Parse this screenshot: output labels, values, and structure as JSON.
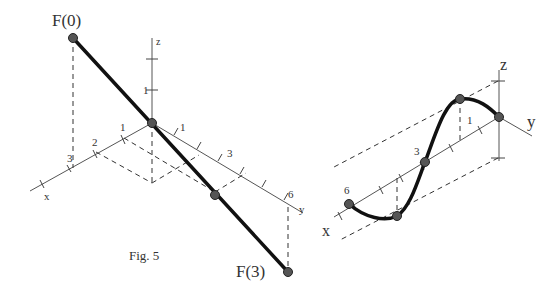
{
  "figure": {
    "caption": "Fig. 5",
    "left_panel": {
      "point_labels": {
        "start": "F(0)",
        "end": "F(3)"
      },
      "axis_labels": {
        "x": "x",
        "y": "y",
        "z": "z"
      },
      "x_ticks": [
        "1",
        "2",
        "3"
      ],
      "y_ticks": [
        "1",
        "3",
        "6"
      ],
      "z_ticks": [
        "1"
      ]
    },
    "right_panel": {
      "axis_labels": {
        "x": "x",
        "y": "y",
        "z": "z"
      },
      "x_ticks": [
        "3",
        "6"
      ],
      "z_ticks": [
        "1"
      ]
    }
  }
}
